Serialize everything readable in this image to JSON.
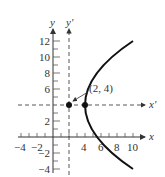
{
  "diagram": {
    "type": "parabola-with-translated-axes",
    "axes": {
      "x_label": "x",
      "y_label": "y",
      "x_prime_label": "x'",
      "y_prime_label": "y'"
    },
    "x_ticks": [
      {
        "value": -4,
        "label": "−4"
      },
      {
        "value": -2,
        "label": "−2"
      },
      {
        "value": 4,
        "label": "4"
      },
      {
        "value": 6,
        "label": "6"
      },
      {
        "value": 8,
        "label": "8"
      },
      {
        "value": 10,
        "label": "10"
      }
    ],
    "y_ticks": [
      {
        "value": 12,
        "label": "12"
      },
      {
        "value": 10,
        "label": "10"
      },
      {
        "value": 8,
        "label": "8"
      },
      {
        "value": 6,
        "label": "6"
      },
      {
        "value": 2,
        "label": "2"
      },
      {
        "value": -2,
        "label": "−2"
      },
      {
        "value": -4,
        "label": "−4"
      }
    ],
    "vertex": {
      "x": 2,
      "y": 4,
      "label": "(2, 4)"
    },
    "focus": {
      "x": 4,
      "y": 4
    },
    "curve": {
      "equation": "(y-4)^2 = 8(x-2)",
      "y_range": [
        -4,
        12
      ]
    },
    "colors": {
      "curve": "#111111",
      "axes": "#333333",
      "text": "#333333"
    }
  }
}
